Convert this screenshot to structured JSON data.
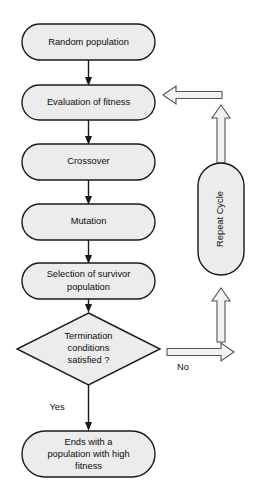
{
  "diagram": {
    "colors": {
      "node_fill": "#ececec",
      "node_stroke": "#1a1a1a",
      "arrow_fill": "#f2f2f2",
      "arrow_stroke": "#555555",
      "background": "#ffffff",
      "text": "#0d0d0d"
    },
    "nodes": {
      "start": {
        "label": "Random population"
      },
      "evaluation": {
        "label": "Evaluation of fitness"
      },
      "crossover": {
        "label": "Crossover"
      },
      "mutation": {
        "label": "Mutation"
      },
      "selection": {
        "line1": "Selection of survivor",
        "line2": "population"
      },
      "decision": {
        "line1": "Termination",
        "line2": "conditions",
        "line3": "satisfied ?"
      },
      "end": {
        "line1": "Ends with a",
        "line2": "population with high",
        "line3": "fitness"
      },
      "repeat_cycle": {
        "label": "Repeat Cycle"
      }
    },
    "edge_labels": {
      "yes": "Yes",
      "no": "No"
    }
  }
}
